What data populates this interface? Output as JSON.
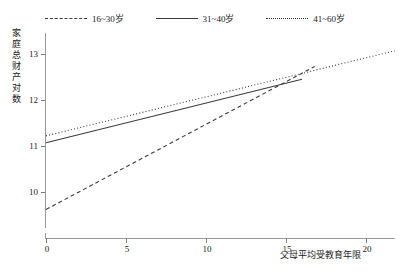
{
  "chart_data": {
    "type": "line",
    "title": "",
    "xlabel": "父母平均受教育年限",
    "ylabel": "家庭总财产对数",
    "xlim": [
      -0.6,
      22.4
    ],
    "ylim": [
      9.35,
      13.25
    ],
    "y_axis_broken_at_zero": true,
    "grid": false,
    "legend_position": "top",
    "xticks": [
      0,
      5,
      10,
      15,
      20
    ],
    "xtick_labels": [
      "0",
      "5",
      "10",
      "15",
      "20"
    ],
    "yticks": [
      10,
      11,
      12,
      13
    ],
    "ytick_labels": [
      "10",
      "11",
      "12",
      "13"
    ],
    "y_zero_tick_label": "0",
    "series": [
      {
        "name": "16~30岁",
        "style": "dashed",
        "color": "#3c3c3c",
        "x": [
          0,
          16.8
        ],
        "values": [
          9.62,
          12.73
        ]
      },
      {
        "name": "31~40岁",
        "style": "solid",
        "color": "#3c3c3c",
        "x": [
          0,
          16.0
        ],
        "values": [
          11.07,
          12.45
        ]
      },
      {
        "name": "41~60岁",
        "style": "dotted",
        "color": "#3c3c3c",
        "x": [
          0,
          21.8
        ],
        "values": [
          11.22,
          13.07
        ]
      }
    ]
  },
  "legend": {
    "items": [
      {
        "label": "16~30岁",
        "style": "dashed"
      },
      {
        "label": "31~40岁",
        "style": "solid"
      },
      {
        "label": "41~60岁",
        "style": "dotted"
      }
    ]
  },
  "axes": {
    "y_title": "家庭总财产对数",
    "x_title": "父母平均受教育年限",
    "y_tick_labels": [
      "13",
      "12",
      "11",
      "10",
      "0"
    ],
    "x_tick_labels": [
      "0",
      "5",
      "10",
      "15",
      "20"
    ]
  }
}
